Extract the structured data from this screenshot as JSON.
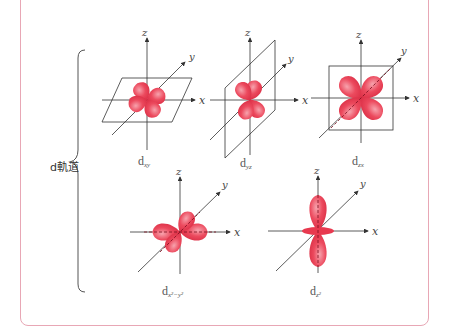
{
  "group": {
    "label": "d軌道"
  },
  "colors": {
    "lobe": "#e8394f",
    "lobe_light": "#f59aa5",
    "axis": "#333333",
    "border": "#e8a7b5"
  },
  "axes": {
    "x": "x",
    "y": "y",
    "z": "z"
  },
  "orbitals": [
    {
      "id": "dxy",
      "base": "d",
      "sub": "xy"
    },
    {
      "id": "dyz",
      "base": "d",
      "sub": "yz"
    },
    {
      "id": "dzx",
      "base": "d",
      "sub": "zx"
    },
    {
      "id": "dx2y2",
      "base": "d",
      "sub": "x²−y²"
    },
    {
      "id": "dz2",
      "base": "d",
      "sub": "z²"
    }
  ]
}
